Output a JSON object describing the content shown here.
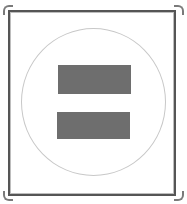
{
  "symbol": {
    "name": "Equals sign",
    "frame_color": "#555555",
    "circle_color": "#c8c8c8",
    "bar_color": "#6e6e6e"
  }
}
